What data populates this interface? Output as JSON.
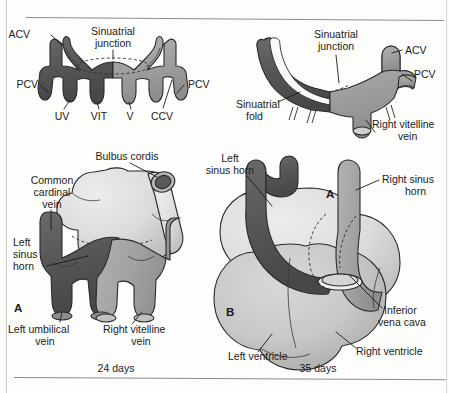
{
  "figure": {
    "rules": {
      "top": true,
      "bottom": true
    }
  },
  "panels": [
    {
      "id": "top-left",
      "name": "symmetric-sinus-venosus",
      "letter": "",
      "caption": "",
      "labels": [
        {
          "key": "acv-left",
          "text": "ACV",
          "x": 30,
          "y": 38
        },
        {
          "key": "pcv-left",
          "text": "PCV",
          "x": 18,
          "y": 88
        },
        {
          "key": "uv",
          "text": "UV",
          "x": 58,
          "y": 114
        },
        {
          "key": "vit",
          "text": "VIT",
          "x": 93,
          "y": 114
        },
        {
          "key": "v",
          "text": "V",
          "x": 128,
          "y": 114
        },
        {
          "key": "ccv",
          "text": "CCV",
          "x": 152,
          "y": 114
        },
        {
          "key": "pcv-right",
          "text": "PCV",
          "x": 186,
          "y": 88
        },
        {
          "key": "sinuatrial-junction-1",
          "text": "Sinuatrial",
          "x": 101,
          "y": 33
        },
        {
          "key": "sinuatrial-junction-2",
          "text": "junction",
          "x": 104,
          "y": 46
        }
      ]
    },
    {
      "id": "top-right",
      "name": "sinuatrial-fold-view",
      "letter": "",
      "caption": "",
      "labels": [
        {
          "key": "sinuatrial-junction-1",
          "text": "Sinuatrial",
          "x": 305,
          "y": 36
        },
        {
          "key": "sinuatrial-junction-2",
          "text": "junction",
          "x": 308,
          "y": 49
        },
        {
          "key": "acv",
          "text": "ACV",
          "x": 404,
          "y": 51
        },
        {
          "key": "pcv",
          "text": "PCV",
          "x": 404,
          "y": 74
        },
        {
          "key": "sinuatrial-fold-1",
          "text": "Sinuatrial",
          "x": 238,
          "y": 105
        },
        {
          "key": "sinuatrial-fold-2",
          "text": "fold",
          "x": 248,
          "y": 118
        },
        {
          "key": "right-vitelline-vein-1",
          "text": "Right vitelline",
          "x": 348,
          "y": 123
        },
        {
          "key": "right-vitelline-vein-2",
          "text": "vein",
          "x": 378,
          "y": 135
        }
      ]
    },
    {
      "id": "bottom-left",
      "name": "heart-24-days",
      "letter": "A",
      "caption": "24 days",
      "labels": [
        {
          "key": "bulbus-cordis",
          "text": "Bulbus cordis",
          "x": 84,
          "y": 158
        },
        {
          "key": "common-cardinal-vein-1",
          "text": "Common",
          "x": 22,
          "y": 182
        },
        {
          "key": "common-cardinal-vein-2",
          "text": "cardinal",
          "x": 26,
          "y": 194
        },
        {
          "key": "common-cardinal-vein-3",
          "text": "vein",
          "x": 42,
          "y": 206
        },
        {
          "key": "left-sinus-horn-1",
          "text": "Left",
          "x": 16,
          "y": 243
        },
        {
          "key": "left-sinus-horn-2",
          "text": "sinus",
          "x": 14,
          "y": 255
        },
        {
          "key": "left-sinus-horn-3",
          "text": "horn",
          "x": 16,
          "y": 267
        },
        {
          "key": "left-umbilical-vein-1",
          "text": "Left umbilical",
          "x": 8,
          "y": 330
        },
        {
          "key": "left-umbilical-vein-2",
          "text": "vein",
          "x": 40,
          "y": 342
        },
        {
          "key": "right-vitelline-vein-1",
          "text": "Right vitelline",
          "x": 104,
          "y": 330
        },
        {
          "key": "right-vitelline-vein-2",
          "text": "vein",
          "x": 140,
          "y": 342
        }
      ]
    },
    {
      "id": "bottom-right",
      "name": "heart-35-days",
      "letter": "B",
      "caption": "35 days",
      "labels": [
        {
          "key": "left-sinus-horn-1",
          "text": "Left",
          "x": 216,
          "y": 159
        },
        {
          "key": "left-sinus-horn-2",
          "text": "sinus horn",
          "x": 196,
          "y": 171
        },
        {
          "key": "right-sinus-horn-1",
          "text": "Right sinus",
          "x": 382,
          "y": 180
        },
        {
          "key": "right-sinus-horn-2",
          "text": "horn",
          "x": 404,
          "y": 192
        },
        {
          "key": "inset-marker-a",
          "text": "A",
          "x": 330,
          "y": 195
        },
        {
          "key": "inferior-vena-cava-1",
          "text": "Inferior",
          "x": 384,
          "y": 311
        },
        {
          "key": "inferior-vena-cava-2",
          "text": "vena cava",
          "x": 376,
          "y": 323
        },
        {
          "key": "left-ventricle",
          "text": "Left ventricle",
          "x": 230,
          "y": 357
        },
        {
          "key": "right-ventricle",
          "text": "Right ventricle",
          "x": 358,
          "y": 352
        }
      ]
    }
  ],
  "colors": {
    "dark_vessel": "#565656",
    "mid_vessel": "#9e9e9e",
    "light_vessel": "#b9b9b9",
    "chamber_light": "#dcdcdc",
    "chamber_mid": "#c4c4c4",
    "outline": "#2a2a2a",
    "page": "#fdfdfc",
    "text": "#1b1b1b"
  }
}
